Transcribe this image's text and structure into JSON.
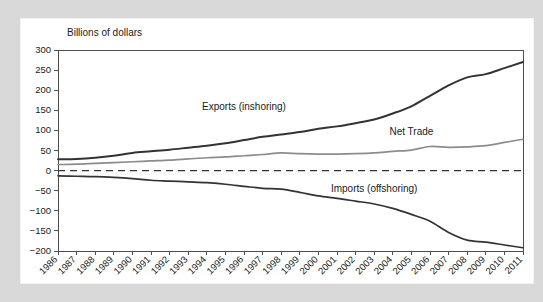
{
  "figure": {
    "background_color": "#d9d9d9",
    "panel_color": "#ffffff"
  },
  "chart_data": {
    "type": "line",
    "title": "",
    "subtitle": "",
    "xlabel": "",
    "ylabel": "Billions of dollars",
    "ylim": [
      -200,
      300
    ],
    "xlim": [
      1986,
      2011
    ],
    "grid": false,
    "legend_position": "inline-annotations",
    "yticks": [
      300,
      250,
      200,
      150,
      100,
      50,
      0,
      -50,
      -100,
      -150,
      -200
    ],
    "ytick_labels": [
      "300",
      "250",
      "200",
      "150",
      "100",
      "50",
      "0",
      "−50",
      "−100",
      "−150",
      "−200"
    ],
    "categories": [
      "1986",
      "1987",
      "1988",
      "1989",
      "1990",
      "1991",
      "1992",
      "1993",
      "1994",
      "1995",
      "1996",
      "1997",
      "1998",
      "1999",
      "2000",
      "2001",
      "2002",
      "2003",
      "2004",
      "2005",
      "2006",
      "2007",
      "2008",
      "2009",
      "2010",
      "2011"
    ],
    "zero_reference_line": 0,
    "series": [
      {
        "name": "Exports (inshoring)",
        "color": "#333333",
        "stroke_width": 2.0,
        "label_x": 1996,
        "label_y": 150,
        "values": [
          28,
          29,
          32,
          37,
          44,
          48,
          52,
          57,
          62,
          68,
          76,
          84,
          90,
          96,
          104,
          110,
          118,
          127,
          142,
          160,
          186,
          212,
          232,
          240,
          255,
          270
        ]
      },
      {
        "name": "Net Trade",
        "color": "#8c8c8c",
        "stroke_width": 1.7,
        "label_x": 2005,
        "label_y": 88,
        "values": [
          15,
          16,
          18,
          20,
          22,
          24,
          26,
          29,
          32,
          34,
          37,
          40,
          44,
          42,
          41,
          41,
          42,
          44,
          48,
          51,
          60,
          58,
          59,
          62,
          70,
          78
        ]
      },
      {
        "name": "Imports (offshoring)",
        "color": "#333333",
        "stroke_width": 1.7,
        "label_x": 2003,
        "label_y": -52,
        "values": [
          -13,
          -14,
          -15,
          -17,
          -20,
          -24,
          -26,
          -28,
          -30,
          -34,
          -39,
          -44,
          -46,
          -54,
          -63,
          -69,
          -76,
          -83,
          -94,
          -109,
          -126,
          -154,
          -173,
          -178,
          -185,
          -192
        ]
      }
    ]
  },
  "annotations": [
    {
      "name": "exports-label",
      "text": "Exports (inshoring)"
    },
    {
      "name": "net-trade-label",
      "text": "Net Trade"
    },
    {
      "name": "imports-label",
      "text": "Imports (offshoring)"
    }
  ]
}
